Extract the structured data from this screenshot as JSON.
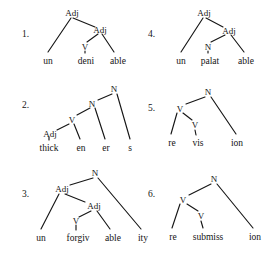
{
  "page": {
    "background_color": "#ffffff",
    "ink_color": "#161616"
  },
  "trees": [
    {
      "number": "1.",
      "word": "undeniable",
      "root_label": "Adj",
      "nodes": [
        {
          "label": "Adj",
          "x": 72,
          "y": 10
        },
        {
          "label": "Adj",
          "x": 100,
          "y": 27
        },
        {
          "label": "V",
          "x": 85,
          "y": 44
        }
      ],
      "leaves": [
        {
          "label": "un",
          "x": 48,
          "y": 59
        },
        {
          "label": "deni",
          "x": 85,
          "y": 59
        },
        {
          "label": "able",
          "x": 115,
          "y": 59
        }
      ]
    },
    {
      "number": "2.",
      "word": "thickeners",
      "root_label": "N",
      "nodes": [
        {
          "label": "N",
          "x": 114,
          "y": 86
        },
        {
          "label": "N",
          "x": 92,
          "y": 101
        },
        {
          "label": "V",
          "x": 72,
          "y": 117
        },
        {
          "label": "Adj",
          "x": 49,
          "y": 131
        }
      ],
      "leaves": [
        {
          "label": "thick",
          "x": 48,
          "y": 146
        },
        {
          "label": "en",
          "x": 79,
          "y": 146
        },
        {
          "label": "er",
          "x": 104,
          "y": 146
        },
        {
          "label": "s",
          "x": 128,
          "y": 146
        }
      ]
    },
    {
      "number": "3.",
      "word": "unforgivability",
      "root_label": "N",
      "nodes": [
        {
          "label": "N",
          "x": 95,
          "y": 170
        },
        {
          "label": "Adj",
          "x": 61,
          "y": 186
        },
        {
          "label": "Adj",
          "x": 94,
          "y": 203
        },
        {
          "label": "V",
          "x": 76,
          "y": 218
        },
        {
          "label": "ity-branch",
          "x": 0,
          "y": 0
        }
      ],
      "leaves": [
        {
          "label": "un",
          "x": 40,
          "y": 236
        },
        {
          "label": "forgiv",
          "x": 76,
          "y": 236
        },
        {
          "label": "able",
          "x": 110,
          "y": 236
        },
        {
          "label": "ity",
          "x": 141,
          "y": 236
        }
      ]
    },
    {
      "number": "4.",
      "word": "unpalatable",
      "root_label": "Adj",
      "nodes": [
        {
          "label": "Adj",
          "x": 204,
          "y": 10
        },
        {
          "label": "Adj",
          "x": 228,
          "y": 28
        },
        {
          "label": "N",
          "x": 208,
          "y": 44
        }
      ],
      "leaves": [
        {
          "label": "un",
          "x": 180,
          "y": 59
        },
        {
          "label": "palat",
          "x": 209,
          "y": 59
        },
        {
          "label": "able",
          "x": 244,
          "y": 59
        }
      ]
    },
    {
      "number": "5.",
      "word": "revision",
      "root_label": "N",
      "nodes": [
        {
          "label": "N",
          "x": 208,
          "y": 89
        },
        {
          "label": "V",
          "x": 180,
          "y": 106
        },
        {
          "label": "V",
          "x": 194,
          "y": 122
        }
      ],
      "leaves": [
        {
          "label": "re",
          "x": 172,
          "y": 141
        },
        {
          "label": "vis",
          "x": 197,
          "y": 141
        },
        {
          "label": "ion",
          "x": 236,
          "y": 141
        }
      ]
    },
    {
      "number": "6.",
      "word": "resubmission",
      "root_label": "N",
      "nodes": [
        {
          "label": "N",
          "x": 214,
          "y": 176
        },
        {
          "label": "V",
          "x": 183,
          "y": 197
        },
        {
          "label": "V",
          "x": 200,
          "y": 213
        }
      ],
      "leaves": [
        {
          "label": "re",
          "x": 173,
          "y": 235
        },
        {
          "label": "submiss",
          "x": 207,
          "y": 235
        },
        {
          "label": "ion",
          "x": 253,
          "y": 235
        }
      ]
    }
  ],
  "numbers": {
    "n1": "1.",
    "n2": "2.",
    "n3": "3.",
    "n4": "4.",
    "n5": "5.",
    "n6": "6."
  },
  "labels": {
    "t1_root": "Adj",
    "t1_mid": "Adj",
    "t1_v": "V",
    "t1_l1": "un",
    "t1_l2": "deni",
    "t1_l3": "able",
    "t2_root": "N",
    "t2_n2": "N",
    "t2_v": "V",
    "t2_adj": "Adj",
    "t2_l1": "thick",
    "t2_l2": "en",
    "t2_l3": "er",
    "t2_l4": "s",
    "t3_root": "N",
    "t3_adj1": "Adj",
    "t3_adj2": "Adj",
    "t3_v": "V",
    "t3_l1": "un",
    "t3_l2": "forgiv",
    "t3_l3": "able",
    "t3_l4": "ity",
    "t4_root": "Adj",
    "t4_mid": "Adj",
    "t4_n": "N",
    "t4_l1": "un",
    "t4_l2": "palat",
    "t4_l3": "able",
    "t5_root": "N",
    "t5_v1": "V",
    "t5_v2": "V",
    "t5_l1": "re",
    "t5_l2": "vis",
    "t5_l3": "ion",
    "t6_root": "N",
    "t6_v1": "V",
    "t6_v2": "V",
    "t6_l1": "re",
    "t6_l2": "submiss",
    "t6_l3": "ion"
  }
}
